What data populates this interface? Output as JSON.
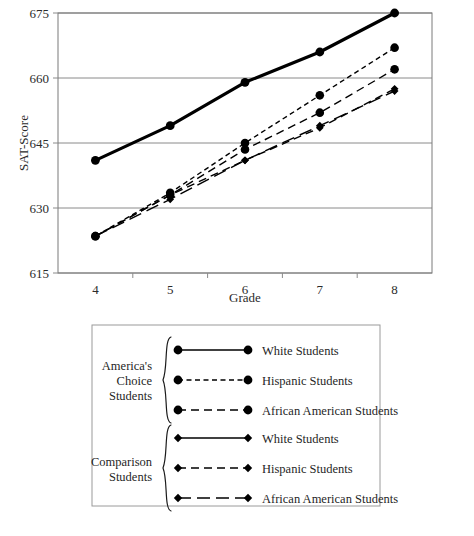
{
  "chart_data": {
    "type": "line",
    "title": "",
    "xlabel": "Grade",
    "ylabel": "SAT-Score",
    "categories": [
      "4",
      "5",
      "6",
      "7",
      "8"
    ],
    "x": [
      4,
      5,
      6,
      7,
      8
    ],
    "ylim": [
      615,
      675
    ],
    "yticks": [
      615,
      630,
      645,
      660,
      675
    ],
    "xticks": [
      4,
      5,
      6,
      7,
      8
    ],
    "grid": true,
    "legend_position": "below-plot",
    "series": [
      {
        "name": "White Students",
        "group": "America's Choice Students",
        "marker": "circle",
        "line": "solid",
        "width": "thick",
        "values": [
          641,
          649,
          659,
          666,
          675
        ]
      },
      {
        "name": "Hispanic Students",
        "group": "America's Choice Students",
        "marker": "circle",
        "line": "dotted",
        "width": "thin",
        "values": [
          623.5,
          633.5,
          645,
          656,
          667
        ]
      },
      {
        "name": "African American Students",
        "group": "America's Choice Students",
        "marker": "circle",
        "line": "dashed",
        "width": "thin",
        "values": [
          623.5,
          633,
          643.5,
          652,
          662
        ]
      },
      {
        "name": "White Students",
        "group": "Comparison Students",
        "marker": "diamond",
        "line": "solid",
        "width": "thin",
        "values": [
          641,
          649,
          659,
          666,
          675
        ]
      },
      {
        "name": "Hispanic Students",
        "group": "Comparison Students",
        "marker": "diamond",
        "line": "dashed",
        "width": "thin",
        "values": [
          623.5,
          633,
          641,
          648.5,
          657.5
        ]
      },
      {
        "name": "African American Students",
        "group": "Comparison Students",
        "marker": "diamond",
        "line": "long-dash",
        "width": "thin",
        "values": [
          623.5,
          632,
          641,
          649,
          657
        ]
      }
    ]
  },
  "axes": {
    "y_label": "SAT-Score",
    "x_label": "Grade",
    "y_ticks": [
      "615",
      "630",
      "645",
      "660",
      "675"
    ],
    "x_ticks": [
      "4",
      "5",
      "6",
      "7",
      "8"
    ]
  },
  "legend": {
    "groups": [
      {
        "label_lines": [
          "America's",
          "Choice",
          "Students"
        ],
        "entries": [
          {
            "label": "White Students",
            "marker": "circle",
            "line": "solid"
          },
          {
            "label": "Hispanic Students",
            "marker": "circle",
            "line": "dotted"
          },
          {
            "label": "African American Students",
            "marker": "circle",
            "line": "dashed"
          }
        ]
      },
      {
        "label_lines": [
          "Comparison",
          "Students"
        ],
        "entries": [
          {
            "label": "White Students",
            "marker": "diamond",
            "line": "solid"
          },
          {
            "label": "Hispanic Students",
            "marker": "diamond",
            "line": "dashed"
          },
          {
            "label": "African American Students",
            "marker": "diamond",
            "line": "long-dash"
          }
        ]
      }
    ]
  },
  "colors": {
    "ink": "#000000",
    "grid": "#8a8a8a",
    "box": "#7a7a7a",
    "text": "#2b2b2b"
  }
}
